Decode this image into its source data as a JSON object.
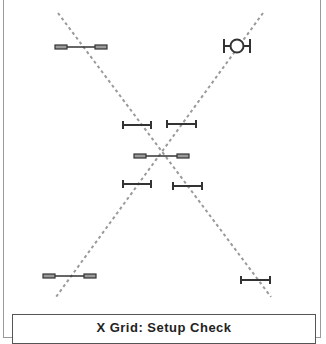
{
  "title": "X Grid: Setup Check",
  "colors": {
    "dash": "#9a9a9a",
    "stroke": "#333333",
    "rect_fill": "#9a9a9a",
    "frame": "#9a9a9a"
  },
  "guides": [
    {
      "name": "diagonal-down",
      "x1": 58,
      "y1": 13,
      "x2": 271,
      "y2": 297
    },
    {
      "name": "diagonal-up",
      "x1": 263,
      "y1": 13,
      "x2": 56,
      "y2": 297
    }
  ],
  "markers": [
    {
      "type": "rect-bar",
      "x1": 55,
      "x2": 107,
      "y": 47
    },
    {
      "type": "circle-bar",
      "x1": 224,
      "x2": 250,
      "y": 46
    },
    {
      "type": "i-bar",
      "x1": 123,
      "x2": 151,
      "y": 125
    },
    {
      "type": "i-bar",
      "x1": 167,
      "x2": 196,
      "y": 124
    },
    {
      "type": "rect-bar",
      "x1": 134,
      "x2": 189,
      "y": 156
    },
    {
      "type": "i-bar",
      "x1": 123,
      "x2": 151,
      "y": 184
    },
    {
      "type": "i-bar",
      "x1": 173,
      "x2": 202,
      "y": 186
    },
    {
      "type": "rect-bar",
      "x1": 43,
      "x2": 96,
      "y": 276
    },
    {
      "type": "i-bar",
      "x1": 241,
      "x2": 270,
      "y": 280
    }
  ]
}
